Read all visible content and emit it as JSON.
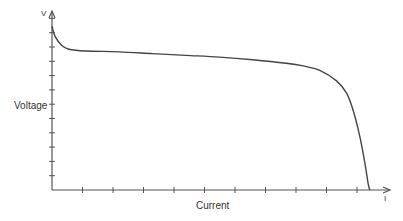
{
  "chart_data": {
    "type": "line",
    "title": "",
    "xlabel": "Current",
    "ylabel": "Voltage",
    "x_axis_symbol": "I",
    "y_axis_symbol": "V",
    "grid": false,
    "legend": null,
    "xlim": [
      0,
      1
    ],
    "ylim": [
      0,
      1
    ],
    "x_ticks_count": 10,
    "y_ticks_count": 12,
    "tick_labels": "none",
    "series": [
      {
        "name": "Discharge curve",
        "color": "#444444",
        "x": [
          0.0,
          0.01,
          0.03,
          0.05,
          0.1,
          0.2,
          0.3,
          0.4,
          0.5,
          0.6,
          0.7,
          0.75,
          0.8,
          0.85,
          0.88,
          0.9,
          0.92,
          0.935,
          0.945,
          0.95
        ],
        "y": [
          0.93,
          0.87,
          0.82,
          0.8,
          0.79,
          0.785,
          0.775,
          0.765,
          0.755,
          0.74,
          0.72,
          0.705,
          0.68,
          0.62,
          0.55,
          0.45,
          0.3,
          0.15,
          0.03,
          0.0
        ]
      }
    ]
  },
  "labels": {
    "y_axis": "Voltage",
    "x_axis": "Current",
    "y_symbol": "V",
    "x_symbol": "I"
  },
  "colors": {
    "axis": "#555555",
    "curve": "#444444",
    "text": "#333333"
  }
}
